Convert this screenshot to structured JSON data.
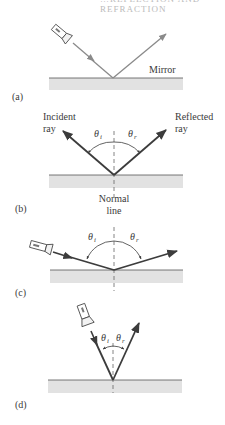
{
  "header": {
    "cropped_text": "…REFLECTION AND REFRACTION"
  },
  "colors": {
    "ray": "#3c3c3c",
    "ray_light": "#8a8a8a",
    "mirror_line": "#555555",
    "mirror_fill": "#e2e2e2",
    "normal": "#666666"
  },
  "panels": [
    {
      "id": "a",
      "label": "(a)",
      "mirror_label": "Mirror"
    },
    {
      "id": "b",
      "label": "(b)",
      "incident_label_1": "Incident",
      "incident_label_2": "ray",
      "reflected_label_1": "Reflected",
      "reflected_label_2": "ray",
      "normal_label_1": "Normal",
      "normal_label_2": "line",
      "theta_i": "θ",
      "theta_i_sub": "i",
      "theta_r": "θ",
      "theta_r_sub": "r"
    },
    {
      "id": "c",
      "label": "(c)",
      "theta_i": "θ",
      "theta_i_sub": "i",
      "theta_r": "θ",
      "theta_r_sub": "r"
    },
    {
      "id": "d",
      "label": "(d)",
      "theta_i": "θ",
      "theta_i_sub": "i",
      "theta_r": "θ",
      "theta_r_sub": "r"
    }
  ]
}
